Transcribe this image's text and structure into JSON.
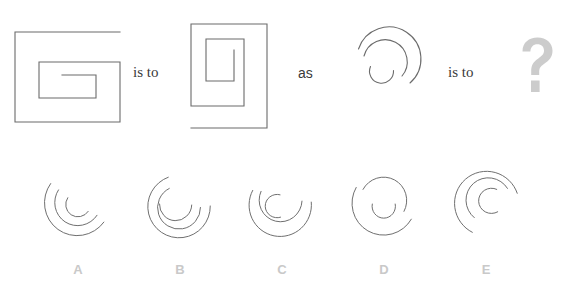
{
  "puzzle": {
    "type": "visual-analogy",
    "title": "",
    "connector_1": "is to",
    "connector_2": "as",
    "connector_3": "is to",
    "answer_placeholder": "?",
    "stroke_color": "#6b6b6b",
    "label_color": "#c9c9c9",
    "question_mark_color": "#cccccc",
    "background_color": "#ffffff",
    "stimuli": [
      {
        "id": "A-term",
        "name": "square-spiral-horizontal",
        "description": "Horizontal rectangular spiral, wide outer square, opening on the right"
      },
      {
        "id": "B-term",
        "name": "square-spiral-vertical",
        "description": "Vertical rectangular spiral, tall narrow outer rectangle, opening at top"
      },
      {
        "id": "C-term",
        "name": "circular-spiral",
        "description": "Circular spiral with two turns, gap at lower right"
      }
    ],
    "options": [
      {
        "letter": "A",
        "name": "option-a-circular-spiral"
      },
      {
        "letter": "B",
        "name": "option-b-circular-spiral"
      },
      {
        "letter": "C",
        "name": "option-c-circular-spiral"
      },
      {
        "letter": "D",
        "name": "option-d-circular-spiral"
      },
      {
        "letter": "E",
        "name": "option-e-circular-spiral"
      }
    ]
  }
}
